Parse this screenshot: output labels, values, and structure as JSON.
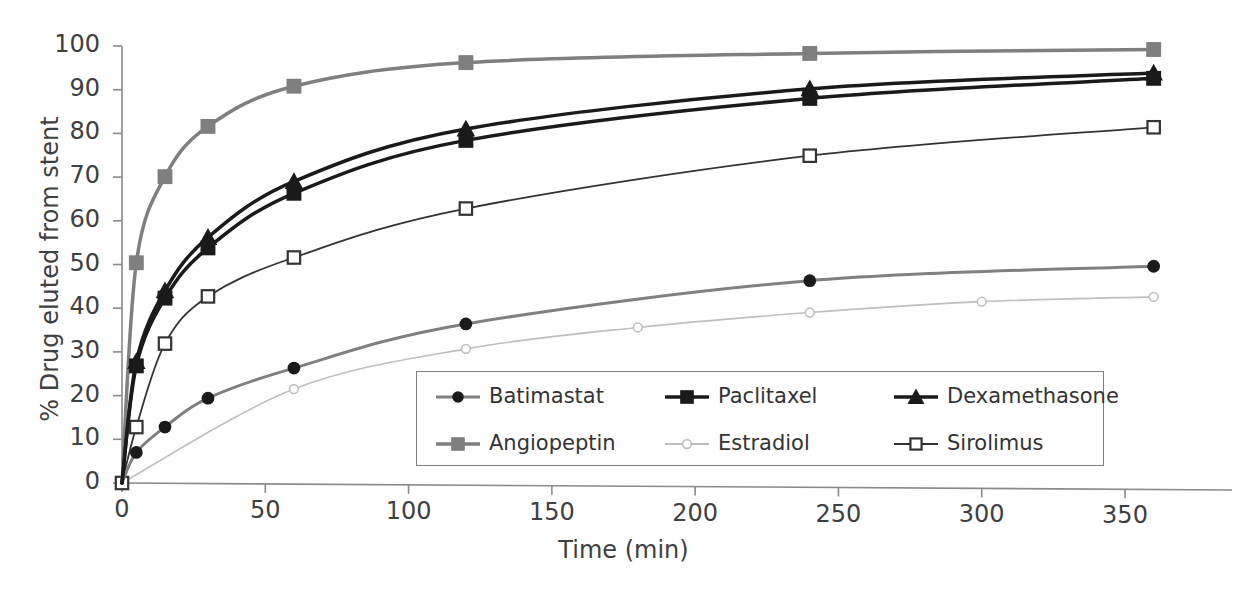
{
  "chart_data": {
    "type": "line",
    "title": "",
    "xlabel": "Time (min)",
    "ylabel": "% Drug eluted from stent",
    "xlim": [
      0,
      375
    ],
    "ylim": [
      0,
      100
    ],
    "xticks": [
      "0",
      "50",
      "100",
      "150",
      "200",
      "250",
      "300",
      "350"
    ],
    "xtick_values": [
      0,
      50,
      100,
      150,
      200,
      250,
      300,
      350
    ],
    "yticks": [
      "0",
      "10",
      "20",
      "30",
      "40",
      "50",
      "60",
      "70",
      "80",
      "90",
      "100"
    ],
    "ytick_values": [
      0,
      10,
      20,
      30,
      40,
      50,
      60,
      70,
      80,
      90,
      100
    ],
    "grid": false,
    "legend_position": "inside lower center",
    "series": [
      {
        "name": "Batimastat",
        "marker": "filled-circle",
        "color": "#808080",
        "marker_color": "#1a1a1a",
        "line_width": 3,
        "x": [
          0,
          5,
          15,
          30,
          60,
          120,
          240,
          360
        ],
        "y": [
          0,
          7.0,
          12.8,
          19.4,
          26.3,
          36.4,
          46.3,
          49.6
        ]
      },
      {
        "name": "Paclitaxel",
        "marker": "filled-square",
        "color": "#1a1a1a",
        "marker_color": "#1a1a1a",
        "line_width": 3.5,
        "x": [
          0,
          5,
          15,
          30,
          60,
          120,
          240,
          360
        ],
        "y": [
          0,
          26.8,
          42.3,
          53.8,
          66.3,
          78.4,
          88.0,
          92.6
        ]
      },
      {
        "name": "Dexamethasone",
        "marker": "filled-triangle",
        "color": "#1a1a1a",
        "marker_color": "#1a1a1a",
        "line_width": 3.5,
        "x": [
          0,
          5,
          15,
          30,
          60,
          120,
          240,
          360
        ],
        "y": [
          0,
          27.8,
          44.0,
          56.2,
          69.0,
          81.0,
          90.2,
          93.8
        ]
      },
      {
        "name": "Angiopeptin",
        "marker": "filled-square",
        "color": "#7f7f7f",
        "marker_color": "#7f7f7f",
        "line_width": 3.5,
        "x": [
          0,
          5,
          15,
          30,
          60,
          120,
          240,
          360
        ],
        "y": [
          0,
          50.4,
          70.1,
          81.6,
          90.8,
          96.2,
          98.3,
          99.2
        ]
      },
      {
        "name": "Estradiol",
        "marker": "open-circle",
        "color": "#bfbfbf",
        "marker_color": "#bfbfbf",
        "line_width": 1.6,
        "x": [
          0,
          60,
          120,
          180,
          240,
          300,
          360
        ],
        "y": [
          0,
          21.5,
          30.7,
          35.6,
          39.0,
          41.5,
          42.6
        ]
      },
      {
        "name": "Sirolimus",
        "marker": "open-square",
        "color": "#333333",
        "marker_color": "#333333",
        "line_width": 1.8,
        "x": [
          0,
          5,
          15,
          30,
          60,
          120,
          240,
          360
        ],
        "y": [
          0,
          12.8,
          31.9,
          42.7,
          51.6,
          62.8,
          74.9,
          81.4
        ]
      }
    ]
  },
  "axes": {
    "x_axis_label": "Time (min)",
    "y_axis_label": "% Drug eluted from stent"
  },
  "legend": {
    "entries": [
      {
        "label": "Batimastat"
      },
      {
        "label": "Paclitaxel"
      },
      {
        "label": "Dexamethasone"
      },
      {
        "label": "Angiopeptin"
      },
      {
        "label": "Estradiol"
      },
      {
        "label": "Sirolimus"
      }
    ]
  },
  "caption": {
    "text": ""
  }
}
